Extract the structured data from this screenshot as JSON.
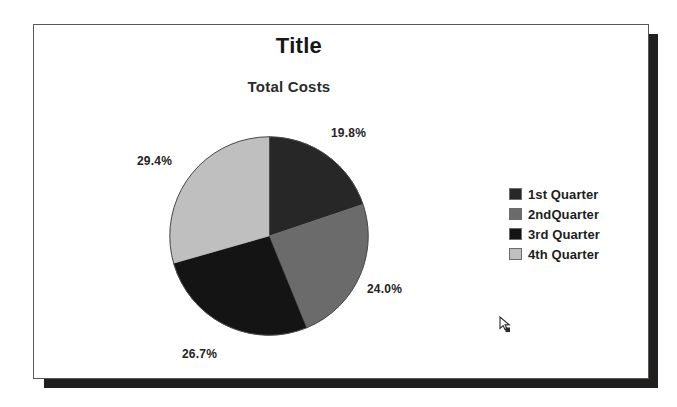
{
  "window": {
    "frame_border_color": "#58575a",
    "shadow_color": "#201f1e",
    "background": "#ffffff"
  },
  "chart_data": {
    "type": "pie",
    "title": "Title",
    "subtitle": "Total Costs",
    "categories": [
      "1st Quarter",
      "2ndQuarter",
      "3rd Quarter",
      "4th Quarter"
    ],
    "values": [
      19.8,
      24.0,
      26.7,
      29.4
    ],
    "value_labels": [
      "19.8%",
      "24.0%",
      "26.7%",
      "29.4%"
    ],
    "colors": [
      "#272727",
      "#6b6b6b",
      "#141414",
      "#bfbfbf"
    ],
    "units": "percent",
    "start_angle_deg": 0,
    "direction": "clockwise",
    "legend_position": "right",
    "grid": false,
    "xlabel": "",
    "ylabel": ""
  },
  "legend": {
    "items": [
      {
        "label": "1st Quarter",
        "color": "#272727"
      },
      {
        "label": "2ndQuarter",
        "color": "#6b6b6b"
      },
      {
        "label": "3rd Quarter",
        "color": "#141414"
      },
      {
        "label": "4th Quarter",
        "color": "#bfbfbf"
      }
    ]
  },
  "cursor": {
    "icon": "mouse-pointer-arrow",
    "x": 503,
    "y": 321
  }
}
